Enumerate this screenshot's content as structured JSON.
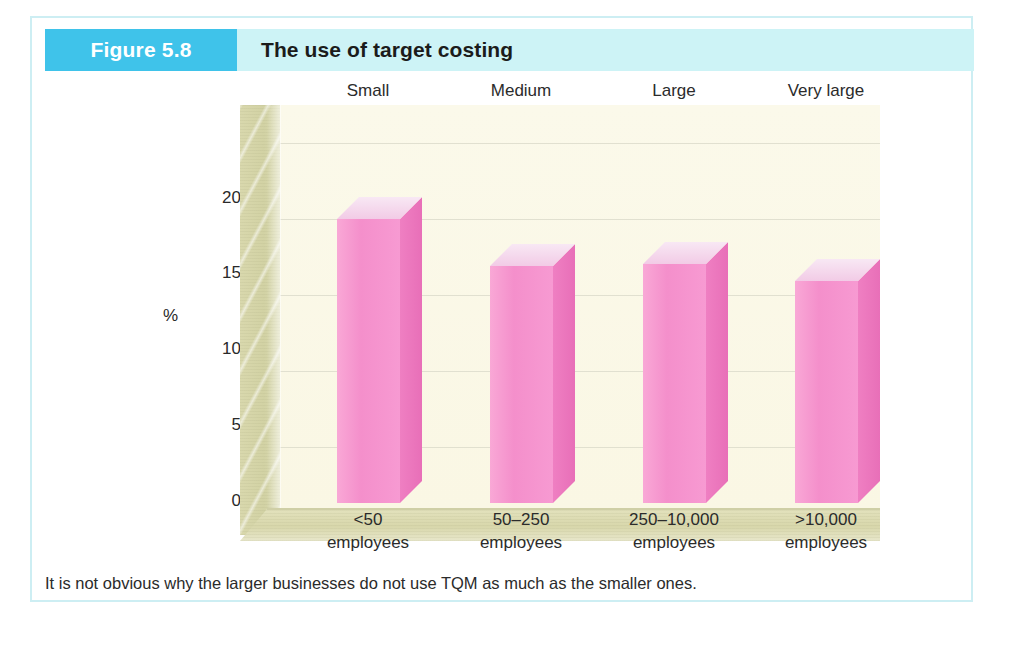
{
  "figure": {
    "badge_label": "Figure 5.8",
    "title": "The use of target costing",
    "caption": "It is not obvious why the larger businesses do not use TQM as much as the smaller ones.",
    "badge_color": "#3fc3ea",
    "header_band_color": "#cdf3f6",
    "border_color": "#cdeef3"
  },
  "chart_data": {
    "type": "bar",
    "title": "The use of target costing",
    "subtitle": "",
    "xlabel": "",
    "ylabel": "%",
    "ylim": [
      0,
      20
    ],
    "yticks": [
      0,
      5,
      10,
      15,
      20
    ],
    "ytick_labels": [
      "0",
      "5",
      "10",
      "15",
      "20"
    ],
    "grid": true,
    "legend": false,
    "three_d": true,
    "bar_color": "#f49ad0",
    "bar_side_color": "#e86fb8",
    "bar_top_color": "#f3cfe8",
    "plot_background": "#faf8e8",
    "wall_color": "#d8d7ab",
    "categories": [
      "<50\nemployees",
      "50–250\nemployees",
      "250–10,000\nemployees",
      ">10,000\nemployees"
    ],
    "category_size_labels": [
      "Small",
      "Medium",
      "Large",
      "Very large"
    ],
    "values": [
      18.7,
      15.6,
      15.7,
      14.6
    ],
    "bars": [
      {
        "size_label": "Small",
        "range_label": "<50",
        "unit_label": "employees",
        "value": 18.7
      },
      {
        "size_label": "Medium",
        "range_label": "50–250",
        "unit_label": "employees",
        "value": 15.6
      },
      {
        "size_label": "Large",
        "range_label": "250–10,000",
        "unit_label": "employees",
        "value": 15.7
      },
      {
        "size_label": "Very large",
        "range_label": ">10,000",
        "unit_label": "employees",
        "value": 14.6
      }
    ]
  }
}
